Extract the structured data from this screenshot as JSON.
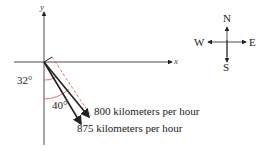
{
  "diagram": {
    "axes": {
      "x_label": "x",
      "y_label": "y"
    },
    "angles": [
      {
        "label": "32°",
        "value": 32,
        "color": "#d9534f"
      },
      {
        "label": "40°",
        "value": 40,
        "color": "#d9534f"
      }
    ],
    "vectors": [
      {
        "label": "800 kilometers per hour",
        "speed": 800,
        "angle_from_south": 32
      },
      {
        "label": "875 kilometers per hour",
        "speed": 875,
        "angle_from_south": 40
      }
    ],
    "compass": {
      "north": "N",
      "south": "S",
      "east": "E",
      "west": "W"
    },
    "colors": {
      "arc": "#d9534f",
      "dashed": "#d9534f",
      "lines": "#222222"
    }
  }
}
